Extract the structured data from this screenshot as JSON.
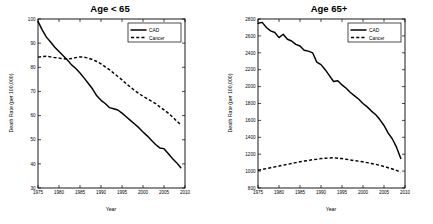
{
  "figure": {
    "background": "#ffffff",
    "line_color": "#000000",
    "panels": [
      "left",
      "right"
    ]
  },
  "chart_data": [
    {
      "type": "line",
      "title": "Age < 65",
      "xlabel": "Year",
      "ylabel": "Death Rate (per 100,000)",
      "xlim": [
        1975,
        2010
      ],
      "ylim": [
        30,
        100
      ],
      "xticks": [
        1975,
        1980,
        1985,
        1990,
        1995,
        2000,
        2005,
        2010
      ],
      "yticks": [
        30,
        40,
        50,
        60,
        70,
        80,
        90,
        100
      ],
      "grid": false,
      "legend_position": "top-right",
      "x": [
        1975,
        1976,
        1977,
        1978,
        1979,
        1980,
        1981,
        1982,
        1983,
        1984,
        1985,
        1986,
        1987,
        1988,
        1989,
        1990,
        1991,
        1992,
        1993,
        1994,
        1995,
        1996,
        1997,
        1998,
        1999,
        2000,
        2001,
        2002,
        2003,
        2004,
        2005,
        2006,
        2007,
        2008,
        2009
      ],
      "series": [
        {
          "name": "CAD",
          "style": "solid",
          "values": [
            99.0,
            95.5,
            92.5,
            90.5,
            88.3,
            86.5,
            84.8,
            83.0,
            81.0,
            79.5,
            77.6,
            75.5,
            73.3,
            71.0,
            68.2,
            66.3,
            65.0,
            63.3,
            62.8,
            62.3,
            61.0,
            59.5,
            58.0,
            56.5,
            55.0,
            53.2,
            51.6,
            49.8,
            48.0,
            46.6,
            46.3,
            44.3,
            42.2,
            40.5,
            38.4
          ]
        },
        {
          "name": "Cancer",
          "style": "dashed",
          "values": [
            84.2,
            84.4,
            84.6,
            84.3,
            84.0,
            83.8,
            83.6,
            83.4,
            83.6,
            84.0,
            84.3,
            84.2,
            83.8,
            83.2,
            82.4,
            81.4,
            80.2,
            79.0,
            77.6,
            76.2,
            74.8,
            73.2,
            71.8,
            70.4,
            69.2,
            68.0,
            67.0,
            66.0,
            65.0,
            63.6,
            62.4,
            61.0,
            59.5,
            57.8,
            56.2
          ]
        }
      ]
    },
    {
      "type": "line",
      "title": "Age 65+",
      "xlabel": "Year",
      "ylabel": "Death Rate (per 100,000)",
      "xlim": [
        1975,
        2010
      ],
      "ylim": [
        800,
        2800
      ],
      "xticks": [
        1975,
        1980,
        1985,
        1990,
        1995,
        2000,
        2005,
        2010
      ],
      "yticks": [
        800,
        1000,
        1200,
        1400,
        1600,
        1800,
        2000,
        2200,
        2400,
        2600,
        2800
      ],
      "grid": false,
      "legend_position": "top-right",
      "x": [
        1975,
        1976,
        1977,
        1978,
        1979,
        1980,
        1981,
        1982,
        1983,
        1984,
        1985,
        1986,
        1987,
        1988,
        1989,
        1990,
        1991,
        1992,
        1993,
        1994,
        1995,
        1996,
        1997,
        1998,
        1999,
        2000,
        2001,
        2002,
        2003,
        2004,
        2005,
        2006,
        2007,
        2008,
        2009
      ],
      "series": [
        {
          "name": "CAD",
          "style": "solid",
          "values": [
            2750,
            2760,
            2700,
            2660,
            2640,
            2580,
            2620,
            2560,
            2540,
            2500,
            2480,
            2430,
            2420,
            2400,
            2290,
            2260,
            2200,
            2130,
            2060,
            2070,
            2020,
            1980,
            1930,
            1890,
            1850,
            1800,
            1760,
            1710,
            1670,
            1610,
            1540,
            1450,
            1380,
            1280,
            1150
          ]
        },
        {
          "name": "Cancer",
          "style": "dashed",
          "values": [
            1010,
            1020,
            1030,
            1040,
            1050,
            1060,
            1070,
            1080,
            1090,
            1100,
            1110,
            1120,
            1125,
            1135,
            1140,
            1148,
            1152,
            1155,
            1158,
            1152,
            1148,
            1140,
            1132,
            1124,
            1118,
            1110,
            1100,
            1090,
            1080,
            1068,
            1055,
            1040,
            1025,
            1008,
            985
          ]
        }
      ]
    }
  ]
}
